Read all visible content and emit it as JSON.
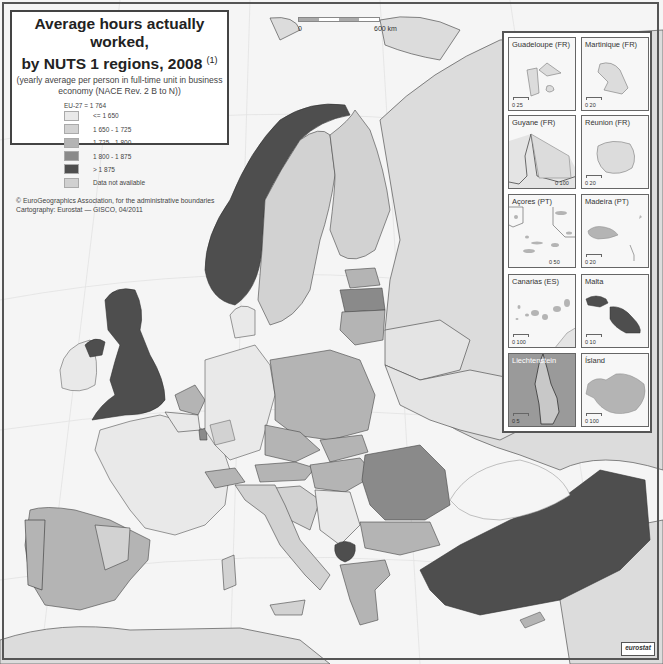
{
  "title": {
    "line1": "Average hours actually worked,",
    "line2": "by NUTS 1 regions, 2008",
    "footnote_ref": "(1)",
    "subtitle": "(yearly average per person in full-time unit in business economy (NACE Rev. 2 B to N))"
  },
  "legend": {
    "eu_average": "EU-27 = 1 764",
    "classes": [
      {
        "label": "<= 1 650",
        "color": "#e9e9e9"
      },
      {
        "label": "1 650 - 1 725",
        "color": "#d2d2d2"
      },
      {
        "label": "1 725 - 1 800",
        "color": "#b4b4b4"
      },
      {
        "label": "1 800 - 1 875",
        "color": "#8a8a8a"
      },
      {
        "label": "> 1 875",
        "color": "#4e4e4e"
      },
      {
        "label": "Data not available",
        "color": "#d0d0d0"
      }
    ]
  },
  "credits": {
    "line1": "© EuroGeographics Association, for the administrative boundaries",
    "line2": "Cartography: Eurostat — GISCO, 04/2011"
  },
  "scale": {
    "start": "0",
    "end": "600 km"
  },
  "insets": [
    {
      "name": "Guadeloupe (FR)",
      "scale": "0    25"
    },
    {
      "name": "Martinique (FR)",
      "scale": "0    20"
    },
    {
      "name": "Guyane (FR)",
      "scale": "0   100"
    },
    {
      "name": "Réunion (FR)",
      "scale": "0    20"
    },
    {
      "name": "Açores (PT)",
      "scale": "0    50"
    },
    {
      "name": "Madeira (PT)",
      "scale": "0    20"
    },
    {
      "name": "Canarias (ES)",
      "scale": "0   100"
    },
    {
      "name": "Malta",
      "scale": "0    10"
    },
    {
      "name": "Liechtenstein",
      "scale": "0    5"
    },
    {
      "name": "Ísland",
      "scale": "0   100"
    }
  ],
  "logo": "eurostat",
  "colors": {
    "sea": "#f5f5f5",
    "non_eu": "#dcdcdc",
    "class1": "#e9e9e9",
    "class2": "#d2d2d2",
    "class3": "#b4b4b4",
    "class4": "#8a8a8a",
    "class5": "#4e4e4e"
  }
}
